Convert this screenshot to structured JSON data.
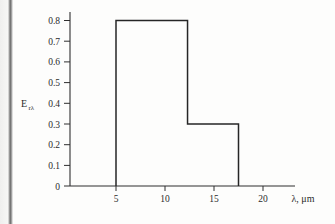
{
  "figure": {
    "background_color": "#fdfdfc",
    "line_color": "#262626",
    "axis_color": "#2e2e2e",
    "gutter_color": "#5d5d5d"
  },
  "axes": {
    "y_title_main": "E",
    "y_title_sub": "rλ",
    "x_title": "λ, μm",
    "y_ticks": [
      "0.8",
      "0.7",
      "0.6",
      "0.5",
      "0.4",
      "0.3",
      "0.2",
      "0.1",
      "0"
    ],
    "x_ticks": [
      "5",
      "10",
      "15",
      "20"
    ]
  },
  "chart_data": {
    "type": "line",
    "title": "",
    "subtitle": "",
    "xlabel": "λ, μm",
    "ylabel": "E_rλ",
    "xlim": [
      0,
      23
    ],
    "ylim": [
      0,
      0.85
    ],
    "grid": false,
    "legend": "none",
    "x_tick_values": [
      5,
      10,
      15,
      20
    ],
    "y_tick_values": [
      0,
      0.1,
      0.2,
      0.3,
      0.4,
      0.5,
      0.6,
      0.7,
      0.8
    ],
    "step_segments": [
      {
        "x_start": 5,
        "x_end": 12.3,
        "value": 0.8
      },
      {
        "x_start": 12.3,
        "x_end": 17.5,
        "value": 0.3
      }
    ],
    "x": [
      5,
      5,
      12.3,
      12.3,
      17.5,
      17.5
    ],
    "y": [
      0,
      0.8,
      0.8,
      0.3,
      0.3,
      0
    ],
    "series": [
      {
        "name": "E_rλ",
        "x": [
          5,
          5,
          12.3,
          12.3,
          17.5,
          17.5
        ],
        "values": [
          0,
          0.8,
          0.8,
          0.3,
          0.3,
          0
        ]
      }
    ],
    "annotations": []
  }
}
